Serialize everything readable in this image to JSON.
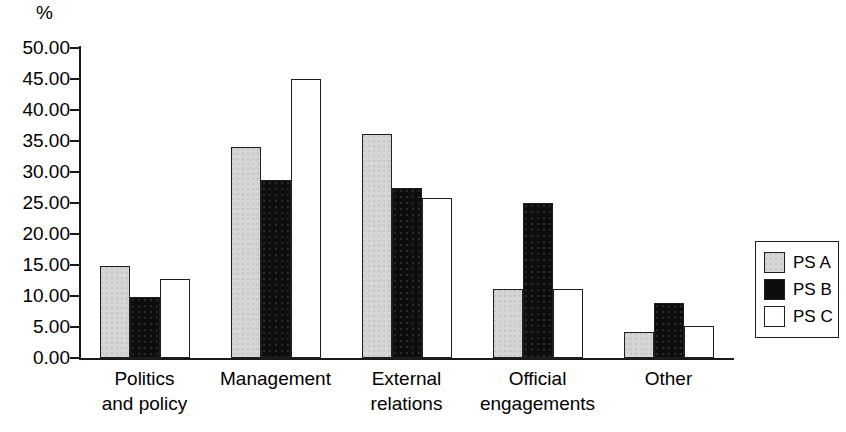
{
  "chart_data": {
    "type": "bar",
    "title": "",
    "subtitle": "",
    "xlabel": "",
    "ylabel": "%",
    "ylim": [
      0,
      50
    ],
    "ytick_step": 5,
    "ytick_labels": [
      "50.00",
      "45.00",
      "40.00",
      "35.00",
      "30.00",
      "25.00",
      "20.00",
      "15.00",
      "10.00",
      "5.00",
      "0.00"
    ],
    "ytick_values": [
      50,
      45,
      40,
      35,
      30,
      25,
      20,
      15,
      10,
      5,
      0
    ],
    "grid": false,
    "legend_position": "right",
    "categories": [
      "Politics and policy",
      "Management",
      "External relations",
      "Official engagements",
      "Other"
    ],
    "category_lines": [
      [
        "Politics",
        "and policy"
      ],
      [
        "Management",
        ""
      ],
      [
        "External",
        "relations"
      ],
      [
        "Official",
        "engagements"
      ],
      [
        "Other",
        ""
      ]
    ],
    "series": [
      {
        "name": "PS A",
        "color": "#d6d6d6",
        "values": [
          14.8,
          34.0,
          36.2,
          11.2,
          4.2
        ]
      },
      {
        "name": "PS B",
        "color": "#0d0d0d",
        "values": [
          9.8,
          28.7,
          27.4,
          25.0,
          8.8
        ]
      },
      {
        "name": "PS C",
        "color": "#ffffff",
        "values": [
          12.8,
          45.0,
          25.8,
          11.2,
          5.1
        ]
      }
    ]
  },
  "legend": {
    "entries": [
      {
        "label": "PS A"
      },
      {
        "label": "PS B"
      },
      {
        "label": "PS C"
      }
    ]
  }
}
